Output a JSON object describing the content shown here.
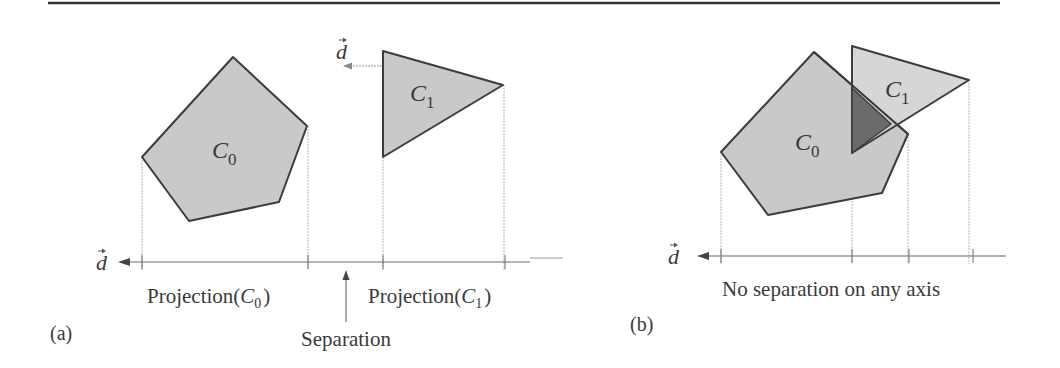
{
  "colors": {
    "shape_fill": "#c9c9c9",
    "overlap_fill": "#6b6b6b",
    "stroke": "#3c3c3c",
    "guide": "#b5b5b5",
    "axis": "#6a6a6a",
    "text": "#3a3a3a"
  },
  "panel_a": {
    "label": "(a)",
    "shape_c0": {
      "name": "C",
      "sub": "0"
    },
    "shape_c1": {
      "name": "C",
      "sub": "1"
    },
    "direction_symbol": "d",
    "axis_symbol": "d",
    "projection_c0": {
      "prefix": "Projection(",
      "name": "C",
      "sub": "0",
      "suffix": ")"
    },
    "projection_c1": {
      "prefix": "Projection(",
      "name": "C",
      "sub": "1",
      "suffix": ")"
    },
    "separation_label": "Separation"
  },
  "panel_b": {
    "label": "(b)",
    "shape_c0": {
      "name": "C",
      "sub": "0"
    },
    "shape_c1": {
      "name": "C",
      "sub": "1"
    },
    "axis_symbol": "d",
    "caption": "No separation on any axis"
  }
}
